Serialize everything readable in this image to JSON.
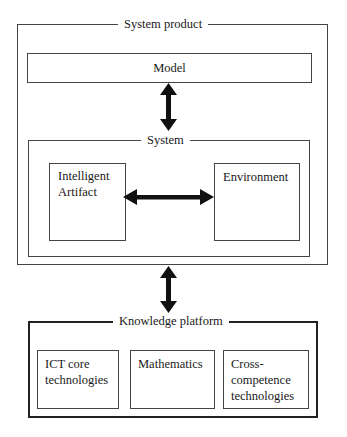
{
  "diagram": {
    "system_product": {
      "title": "System product"
    },
    "model": {
      "label": "Model"
    },
    "system": {
      "title": "System",
      "intelligent_artifact": {
        "line1": "Intelligent",
        "line2": "Artifact"
      },
      "environment": {
        "label": "Environment"
      }
    },
    "knowledge_platform": {
      "title": "Knowledge platform",
      "boxes": [
        {
          "line1": "ICT core",
          "line2": "technologies",
          "line3": ""
        },
        {
          "line1": "Mathematics",
          "line2": "",
          "line3": ""
        },
        {
          "line1": "Cross-",
          "line2": "competence",
          "line3": "technologies"
        }
      ]
    },
    "arrows": [
      {
        "from": "Model",
        "to": "System",
        "type": "bidirectional-vertical"
      },
      {
        "from": "Intelligent Artifact",
        "to": "Environment",
        "type": "bidirectional-horizontal"
      },
      {
        "from": "System product",
        "to": "Knowledge platform",
        "type": "bidirectional-vertical"
      }
    ],
    "colors": {
      "line": "#222222",
      "background": "#ffffff",
      "text": "#1a1a1a"
    }
  }
}
